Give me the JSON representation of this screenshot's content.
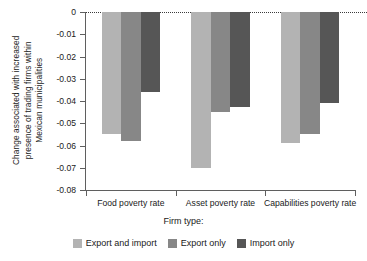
{
  "chart_data": {
    "type": "bar",
    "title": "",
    "subtitle": "",
    "xlabel": "Firm type:",
    "ylabel": "Change associated with increased presence of trading firms within Mexican municipalities",
    "ylabel_line1": "Change associated with increased",
    "ylabel_line2": "presence of trading firms within",
    "ylabel_line3": "Mexican municipalities",
    "categories": [
      "Food poverty rate",
      "Asset poverty rate",
      "Capabilities poverty rate"
    ],
    "series": [
      {
        "name": "Export and import",
        "color": "#b3b3b3",
        "values": [
          -0.055,
          -0.07,
          -0.059
        ]
      },
      {
        "name": "Export only",
        "color": "#878787",
        "values": [
          -0.058,
          -0.045,
          -0.055
        ]
      },
      {
        "name": "Import only",
        "color": "#565656",
        "values": [
          -0.036,
          -0.0425,
          -0.041
        ]
      }
    ],
    "ylim": [
      -0.08,
      0
    ],
    "yticks": [
      0,
      -0.01,
      -0.02,
      -0.03,
      -0.04,
      -0.05,
      -0.06,
      -0.07,
      -0.08
    ],
    "ytick_labels": [
      "0",
      "-0.01",
      "-0.02",
      "-0.03",
      "-0.04",
      "-0.05",
      "-0.06",
      "-0.07",
      "-0.08"
    ],
    "grid": false,
    "zero_line": "dotted",
    "legend_position": "bottom",
    "legend_title": "Firm type:"
  }
}
